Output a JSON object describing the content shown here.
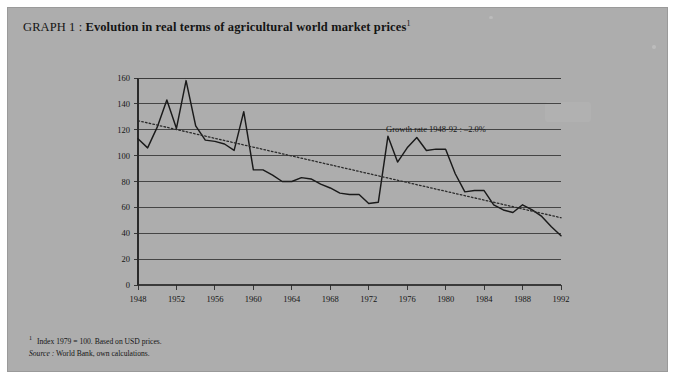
{
  "card": {
    "background": "#adadad"
  },
  "title": {
    "prefix": "GRAPH 1 : ",
    "text": "Evolution in real terms of agricultural world market prices",
    "footnote_marker": "1"
  },
  "notes": {
    "marker": "1",
    "note1": "Index 1979 = 100. Based on USD prices.",
    "source_label": "Source :",
    "source_text": " World Bank, own calculations."
  },
  "chart_data": {
    "type": "line",
    "title": "Evolution in real terms of agricultural world market prices",
    "xlabel": "",
    "ylabel": "",
    "xlim": [
      1948,
      1992
    ],
    "ylim": [
      0,
      160
    ],
    "ytick_step": 20,
    "xtick_step": 4,
    "grid": true,
    "grid_axis": "y",
    "yticks": [
      0,
      20,
      40,
      60,
      80,
      100,
      120,
      140,
      160
    ],
    "xticks": [
      1948,
      1952,
      1956,
      1960,
      1964,
      1968,
      1972,
      1976,
      1980,
      1984,
      1988,
      1992
    ],
    "annotation": "Growth rate 1948-92 : –2.0%",
    "annotation_x": 1979,
    "annotation_y": 118,
    "series": [
      {
        "name": "Real agricultural world market price index",
        "style": "solid",
        "color": "#1a1a1a",
        "x": [
          1948,
          1949,
          1950,
          1951,
          1952,
          1953,
          1954,
          1955,
          1956,
          1957,
          1958,
          1959,
          1960,
          1961,
          1962,
          1963,
          1964,
          1965,
          1966,
          1967,
          1968,
          1969,
          1970,
          1971,
          1972,
          1973,
          1974,
          1975,
          1976,
          1977,
          1978,
          1979,
          1980,
          1981,
          1982,
          1983,
          1984,
          1985,
          1986,
          1987,
          1988,
          1989,
          1990,
          1991,
          1992
        ],
        "values": [
          113,
          106,
          122,
          143,
          121,
          158,
          123,
          112,
          111,
          109,
          104,
          134,
          89,
          89,
          85,
          80,
          80,
          83,
          82,
          78,
          75,
          71,
          70,
          70,
          63,
          64,
          115,
          95,
          106,
          114,
          104,
          105,
          105,
          86,
          72,
          73,
          73,
          62,
          58,
          56,
          62,
          58,
          53,
          45,
          38
        ]
      },
      {
        "name": "Trend 1948-92",
        "style": "dotted",
        "color": "#2b2b2b",
        "x": [
          1948,
          1992
        ],
        "values": [
          127,
          52
        ]
      }
    ]
  }
}
